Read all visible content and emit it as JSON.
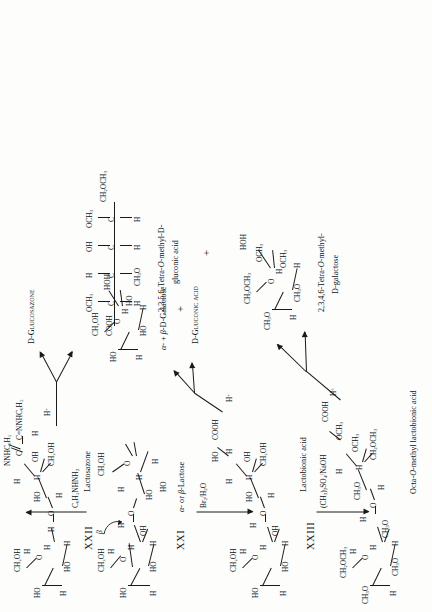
{
  "figure": {
    "type": "chemical-reaction-scheme",
    "orientation": "rotated-90-ccw"
  },
  "compounds": {
    "lactose": {
      "roman": "XXI",
      "name": "α- or β-Lactose",
      "anomeric_label": "β",
      "galactose_ring": {
        "c6": "CH₂OH",
        "ring_o": "O",
        "oh_left": "HO",
        "oh_mid": "HO",
        "h_top": "H",
        "h_a": "H",
        "h_b": "H",
        "h_c": "H",
        "h_d": "H",
        "oh_anomeric": "OH"
      },
      "glucose_ring": {
        "c6": "CH₂OH",
        "ring_o": "O",
        "oh_top": "HO",
        "oh_left": "HO",
        "h_top": "H",
        "h_a": "H",
        "h_b": "H",
        "h_c": "H",
        "anomeric_oh": "HOH"
      },
      "glycosidic_o": "O"
    },
    "lactosazone": {
      "roman": "XXII",
      "name": "Lactosazone",
      "osazone_top": "NNHC₆H₅",
      "osazone_bottom": "C=NNHC₆H₅",
      "carbon": "C",
      "h_osazone": "H",
      "oh": "OH",
      "c6": "CH₂OH",
      "h_labels": [
        "H",
        "H",
        "H",
        "H"
      ],
      "ho_labels": [
        "HO",
        "HO",
        "HO"
      ],
      "ring_o": "O",
      "glycosidic_o": "O",
      "galactose_c6": "CH₂OH"
    },
    "lactobionic_acid": {
      "roman": "XXIII",
      "name": "Lactobionic acid",
      "cooh": "COOH",
      "oh_labels": [
        "OH",
        "OH"
      ],
      "ho_labels": [
        "HO",
        "HO",
        "HO"
      ],
      "h_labels": [
        "H",
        "H",
        "H",
        "H",
        "H"
      ],
      "c6_open": "CH₂OH",
      "c6_ring": "CH₂OH",
      "ring_o": "O",
      "glycosidic_o": "O"
    },
    "octa_methyl_lactobionic_acid": {
      "name": "Octa-O-methyl lactobionic acid",
      "cooh": "COOH",
      "och3_labels": [
        "OCH₃",
        "OCH₃"
      ],
      "ch3o_labels": [
        "CH₃O",
        "CH₃O",
        "CH₃O",
        "CH₃O"
      ],
      "ch2och3_labels": [
        "CH₂OCH₃",
        "CH₂OCH₃"
      ],
      "h_labels": [
        "H",
        "H",
        "H",
        "H",
        "H",
        "H"
      ],
      "ring_o": "O",
      "glycosidic_o": "O"
    },
    "galactose_products": {
      "name": "α- + β-D-Galactose",
      "ring_o": "O",
      "c6": "CH₂OH",
      "anomeric": "HOH",
      "ho_labels": [
        "HO",
        "HO",
        "HO"
      ],
      "h_labels": [
        "H",
        "H",
        "H"
      ]
    },
    "tetra_methyl_galactose": {
      "name_line1": "2,3,4,6-Tetra-O-methyl-",
      "name_line2": "D-galactose",
      "ring_o": "O",
      "c6": "CH₂OCH₃",
      "anomeric": "HOH",
      "och3_labels": [
        "OCH₃",
        "OCH₃"
      ],
      "ch3o_labels": [
        "CH₃O",
        "CH₃O"
      ],
      "h_labels": [
        "H",
        "H",
        "H"
      ]
    },
    "tetra_methyl_gluconic_acid": {
      "name_line1": "2,3,5,6-Tetra-O-methyl-D-",
      "name_line2": "gluconic acid",
      "chain_top": "COOH",
      "chain_bottom": "CH₂OCH₃",
      "carbons": [
        "C",
        "C",
        "C",
        "C"
      ],
      "right_substituents": [
        "OCH₃",
        "H",
        "OH",
        "OCH₃"
      ],
      "left_substituents": [
        "H",
        "CH₃O",
        "H",
        "H"
      ]
    }
  },
  "products": {
    "glucosazone": "D-Glucosazone",
    "gluconic_acid": "D-Gluconic acid"
  },
  "reagents": {
    "phenylhydrazine": "C₆H₅NHNH₂",
    "bromine_water": "Br₂/H₂O",
    "dimethyl_sulfate": "(CH₃)₂SO₄/NaOH",
    "acid_1": "H⁺",
    "acid_2": "H⁺",
    "acid_3": "H⁺"
  },
  "symbols": {
    "plus": "+"
  },
  "colors": {
    "ink": "#1a1a1a",
    "paper": "#fdfdfc"
  }
}
